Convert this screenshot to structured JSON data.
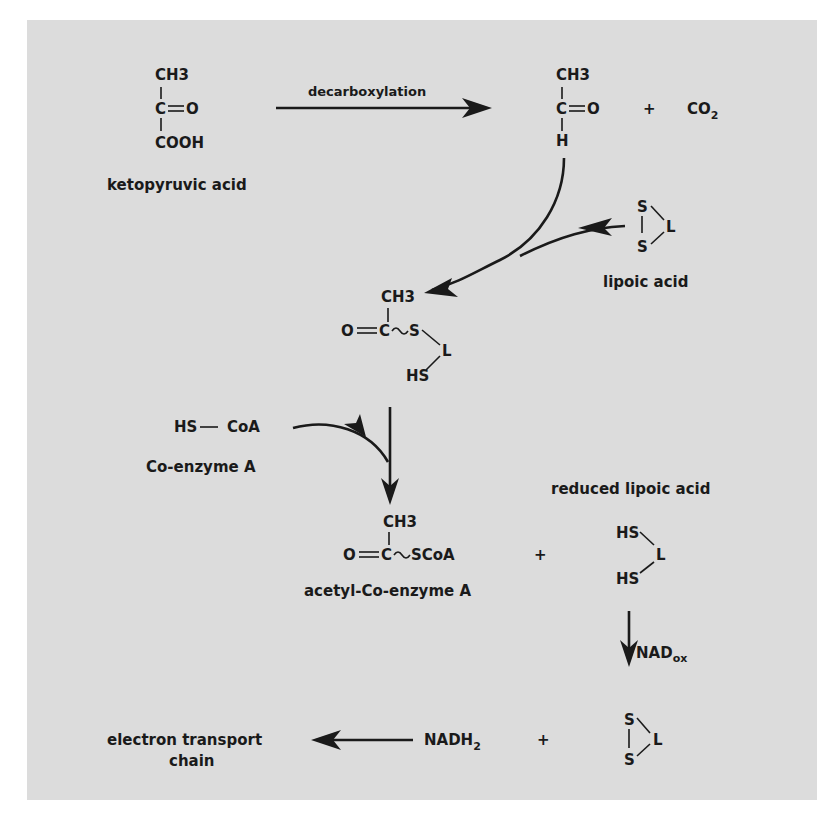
{
  "diagram": {
    "type": "biochemical-pathway",
    "background_color": "#dcdcdc",
    "ink_color": "#1a1a1a",
    "compounds": {
      "ketopyruvic": {
        "top": "CH3",
        "middle_left": "C",
        "middle_right": "O",
        "bottom": "COOH",
        "name": "ketopyruvic acid"
      },
      "acetaldehyde": {
        "top": "CH3",
        "middle_left": "C",
        "middle_right": "O",
        "bottom": "H"
      },
      "co2": {
        "text": "CO",
        "sub": "2"
      },
      "lipoic": {
        "s_top": "S",
        "s_bottom": "S",
        "l": "L",
        "name": "lipoic acid"
      },
      "thioester": {
        "top": "CH3",
        "o": "O",
        "c": "C",
        "s": "S",
        "l": "L",
        "hs": "HS"
      },
      "coa": {
        "hs": "HS",
        "coa": "CoA",
        "name": "Co-enzyme A"
      },
      "acetyl_coa": {
        "top": "CH3",
        "o": "O",
        "c": "C",
        "scoa": "SCoA",
        "name": "acetyl-Co-enzyme A"
      },
      "reduced_lipoic": {
        "hs_top": "HS",
        "hs_bottom": "HS",
        "l": "L",
        "name": "reduced lipoic acid"
      },
      "lipoic_regen": {
        "s_top": "S",
        "s_bottom": "S",
        "l": "L"
      },
      "nadh": {
        "text": "NADH",
        "sub": "2"
      },
      "etc": {
        "line1": "electron transport",
        "line2": "chain"
      }
    },
    "arrows": {
      "decarboxylation": "decarboxylation",
      "nad_ox": {
        "text": "NAD",
        "sub": "ox"
      }
    },
    "plus_signs": [
      "+",
      "+",
      "+"
    ]
  }
}
